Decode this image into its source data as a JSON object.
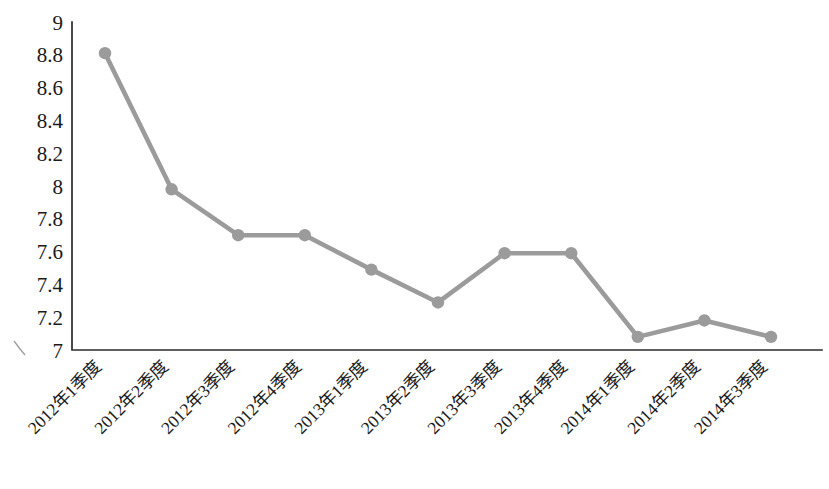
{
  "chart_data": {
    "type": "line",
    "title": "",
    "subtitle": "",
    "xlabel": "",
    "ylabel": "",
    "categories": [
      "2012年1季度",
      "2012年2季度",
      "2012年3季度",
      "2012年4季度",
      "2013年1季度",
      "2013年2季度",
      "2013年3季度",
      "2013年4季度",
      "2014年1季度",
      "2014年2季度",
      "2014年3季度"
    ],
    "values": [
      8.81,
      7.98,
      7.7,
      7.7,
      7.49,
      7.29,
      7.59,
      7.59,
      7.08,
      7.18,
      7.08
    ],
    "series": [
      {
        "name": "",
        "values": [
          8.81,
          7.98,
          7.7,
          7.7,
          7.49,
          7.29,
          7.59,
          7.59,
          7.08,
          7.18,
          7.08
        ]
      }
    ],
    "ylim": [
      7,
      9
    ],
    "ytick_labels": [
      "9",
      "8.8",
      "8.6",
      "8.4",
      "8.2",
      "8",
      "7.8",
      "7.6",
      "7.4",
      "7.2",
      "7"
    ],
    "ytick_values": [
      9,
      8.8,
      8.6,
      8.4,
      8.2,
      8,
      7.8,
      7.6,
      7.4,
      7.2,
      7
    ],
    "grid": false,
    "legend": "none",
    "xtick_rotation_degrees": -45,
    "colors": {
      "series": "#9b9b9b",
      "marker": "#9b9b9b",
      "axis": "#2b2b2b",
      "text": "#1a1a1a",
      "background": "#ffffff"
    }
  }
}
